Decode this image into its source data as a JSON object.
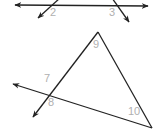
{
  "diagram": {
    "type": "geometry-angles",
    "line_color": "#222222",
    "label_color": "#b0b0b0",
    "top_figure": {
      "description": "Horizontal line crossed by two transversals",
      "angle_labels": {
        "a2": "2",
        "a3": "3"
      }
    },
    "bottom_figure": {
      "description": "Triangle with one side and the base extended as rays",
      "angle_labels": {
        "a7": "7",
        "a8": "8",
        "a9": "9",
        "a10": "10"
      }
    }
  }
}
